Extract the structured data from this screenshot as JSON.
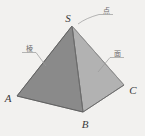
{
  "figure": {
    "background_color": "#f2f1ef"
  },
  "solid": {
    "name": "square pyramid S-ABCD",
    "apex_label": "S",
    "vertices": [
      {
        "label": "A",
        "x": 17,
        "y": 96
      },
      {
        "label": "B",
        "x": 83,
        "y": 112
      },
      {
        "label": "C",
        "x": 124,
        "y": 85
      },
      {
        "label": "S",
        "x": 72,
        "y": 26
      }
    ],
    "faces": [
      {
        "name": "face-SAB",
        "fill": "#8a8a8a"
      },
      {
        "name": "face-SBC",
        "fill": "#b2b2b2"
      }
    ],
    "edge_color": "#6b6b6b"
  },
  "annotations": [
    {
      "key": "vertex",
      "label": "点",
      "target": "apex S",
      "x": 106,
      "y": 11
    },
    {
      "key": "edge",
      "label": "棱",
      "target": "edge SA",
      "x": 28,
      "y": 49
    },
    {
      "key": "face",
      "label": "面",
      "target": "face SBC",
      "x": 117,
      "y": 54
    }
  ],
  "vertex_labels": {
    "A": "A",
    "B": "B",
    "C": "C",
    "S": "S"
  }
}
